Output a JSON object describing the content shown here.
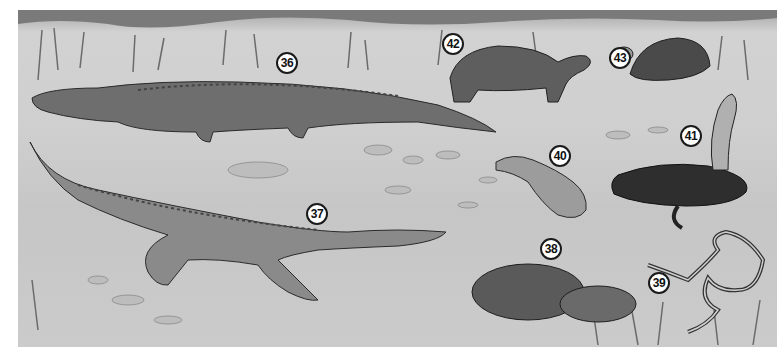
{
  "illustration": {
    "description": "Grayscale illustration of reptiles in a marsh/sandy setting",
    "colors": {
      "background": "#ffffff",
      "ground": "#cccccc",
      "ink": "#1a1a1a"
    },
    "labels": [
      {
        "number": "36",
        "subject": "alligator",
        "x": 287,
        "y": 62
      },
      {
        "number": "37",
        "subject": "crocodile",
        "x": 317,
        "y": 213
      },
      {
        "number": "38",
        "subject": "rattlesnake",
        "x": 551,
        "y": 248
      },
      {
        "number": "39",
        "subject": "garter snake",
        "x": 659,
        "y": 282
      },
      {
        "number": "40",
        "subject": "salamander-like lizard",
        "x": 560,
        "y": 155
      },
      {
        "number": "41",
        "subject": "cobra",
        "x": 691,
        "y": 135
      },
      {
        "number": "42",
        "subject": "tortoise",
        "x": 453,
        "y": 43
      },
      {
        "number": "43",
        "subject": "box turtle",
        "x": 620,
        "y": 57
      }
    ]
  }
}
